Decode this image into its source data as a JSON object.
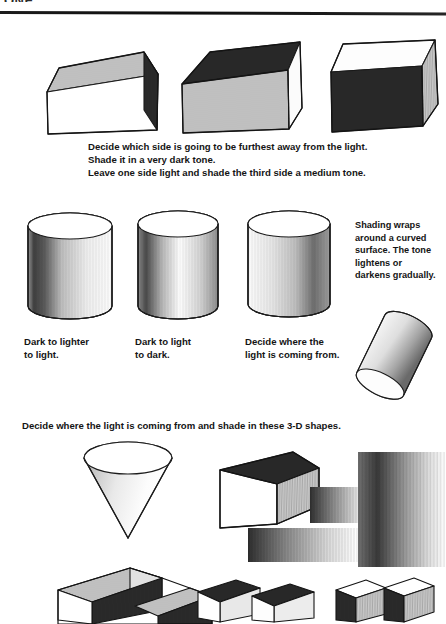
{
  "page": {
    "header_fragment": "ONE",
    "background_color": "#ffffff",
    "ink_color": "#141414"
  },
  "sections": {
    "cubes": {
      "instruction_lines": [
        "Decide which side is going to be furthest away from the light.",
        "Shade it in a very dark tone.",
        "Leave one side light and shade the third side a medium tone."
      ],
      "shapes": [
        {
          "name": "cube-1",
          "top_tone": "medium",
          "front_tone": "light",
          "side_tone": "dark"
        },
        {
          "name": "cube-2",
          "top_tone": "dark",
          "front_tone": "medium",
          "side_tone": "light"
        },
        {
          "name": "cube-3",
          "top_tone": "light",
          "front_tone": "dark",
          "side_tone": "medium"
        }
      ]
    },
    "cylinders": {
      "side_note": "Shading wraps\naround a curved\nsurface. The tone\nlightens or\ndarkens gradually.",
      "captions": [
        "Dark to lighter\nto light.",
        "Dark to light\nto dark.",
        "Decide where the\nlight is coming from."
      ],
      "shapes": [
        {
          "name": "cylinder-1",
          "gradient": "dark-left-to-light-right"
        },
        {
          "name": "cylinder-2",
          "gradient": "dark-left-light-middle-dark-right"
        },
        {
          "name": "cylinder-3",
          "gradient": "light-left-to-dark-right"
        },
        {
          "name": "cylinder-tilted",
          "gradient": "light-left-to-dark-right"
        }
      ]
    },
    "exercise": {
      "instruction": "Decide where the light is coming from and shade in these 3-D shapes.",
      "shapes": [
        {
          "name": "cone",
          "orientation": "point-down"
        },
        {
          "name": "rectangular-prism",
          "top_tone": "dark",
          "front_tone": "light",
          "side_tone": "medium"
        },
        {
          "name": "pencil-stroke-swatch-small"
        },
        {
          "name": "pencil-stroke-swatch-wide"
        },
        {
          "name": "pencil-stroke-swatch-tall"
        },
        {
          "name": "step-block-large"
        },
        {
          "name": "step-block-pair-middle"
        },
        {
          "name": "step-block-pair-right"
        }
      ]
    }
  },
  "tones": {
    "light": "#ffffff",
    "medium": "#b9b9b9",
    "dark": "#3a3a3a",
    "outline": "#1a1a1a"
  }
}
